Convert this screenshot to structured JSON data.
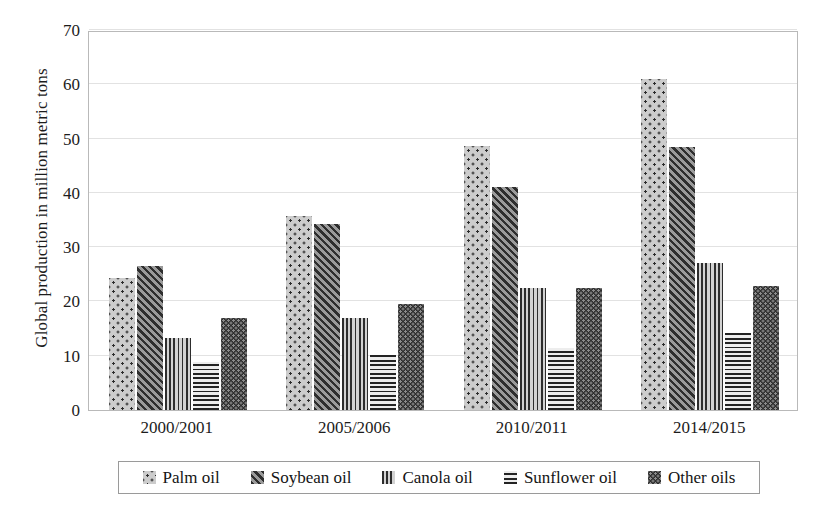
{
  "chart_data": {
    "type": "bar",
    "title": "",
    "xlabel": "",
    "ylabel": "Global production in million metric tons",
    "categories": [
      "2000/2001",
      "2005/2006",
      "2010/2011",
      "2014/2015"
    ],
    "series": [
      {
        "name": "Palm oil",
        "pattern": "dotted-light",
        "values": [
          24.3,
          35.8,
          48.7,
          61.0
        ]
      },
      {
        "name": "Soybean oil",
        "pattern": "diagonal-hatch",
        "values": [
          26.6,
          34.3,
          41.0,
          48.4
        ]
      },
      {
        "name": "Canola oil",
        "pattern": "vertical-lines",
        "values": [
          13.3,
          17.0,
          22.5,
          27.0
        ]
      },
      {
        "name": "Sunflower oil",
        "pattern": "horizontal-lines",
        "values": [
          8.9,
          10.2,
          11.5,
          14.2
        ]
      },
      {
        "name": "Other oils",
        "pattern": "dotted-dark",
        "values": [
          17.0,
          19.6,
          22.4,
          22.9
        ]
      }
    ],
    "ylim": [
      0,
      70
    ],
    "yticks": [
      0,
      10,
      20,
      30,
      40,
      50,
      60,
      70
    ],
    "ytick_labels": [
      "0",
      "10",
      "20",
      "30",
      "40",
      "50",
      "60",
      "70"
    ],
    "grid": true,
    "grid_axis": "y",
    "legend_position": "bottom",
    "legend_entries": [
      "Palm oil",
      "Soybean oil",
      "Canola oil",
      "Sunflower oil",
      "Other oils"
    ]
  },
  "legend": {
    "items": [
      {
        "label": "Palm oil",
        "swatch": "palm-oil-swatch-icon"
      },
      {
        "label": "Soybean oil",
        "swatch": "soybean-oil-swatch-icon"
      },
      {
        "label": "Canola oil",
        "swatch": "canola-oil-swatch-icon"
      },
      {
        "label": "Sunflower oil",
        "swatch": "sunflower-oil-swatch-icon"
      },
      {
        "label": "Other oils",
        "swatch": "other-oils-swatch-icon"
      }
    ]
  },
  "colors": {
    "palm_oil": "#cccccc",
    "soybean_oil": "#6e6e6e",
    "canola_oil": "#b0b0b0",
    "sunflower_oil": "#d8d8d8",
    "other_oils": "#2f2f2f",
    "axis": "#b9b9b9",
    "grid": "#e2e2e2",
    "text": "#1c1c1c"
  }
}
